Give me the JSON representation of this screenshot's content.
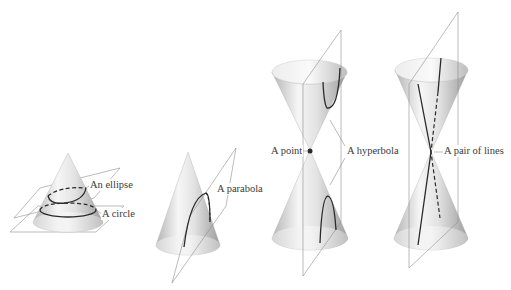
{
  "figure": {
    "panels": [
      {
        "id": "ellipse-circle",
        "shape": "single cone",
        "labels": [
          "An ellipse",
          "A circle"
        ]
      },
      {
        "id": "parabola",
        "shape": "single cone",
        "labels": [
          "A parabola"
        ]
      },
      {
        "id": "point-hyperbola",
        "shape": "double cone",
        "labels": [
          "A point",
          "A hyperbola"
        ]
      },
      {
        "id": "pair-of-lines",
        "shape": "double cone",
        "labels": [
          "A pair of lines"
        ]
      }
    ]
  },
  "labels": {
    "ellipse": "An ellipse",
    "circle": "A circle",
    "parabola": "A parabola",
    "point": "A point",
    "hyperbola": "A hyperbola",
    "pair_of_lines": "A pair of lines"
  },
  "colors": {
    "cone_light": "#f4f4f4",
    "cone_dark": "#a8a8a8",
    "plane_line": "#8a8a8a",
    "curve": "#2a2a2a",
    "label_text": "#3a3a3a"
  }
}
